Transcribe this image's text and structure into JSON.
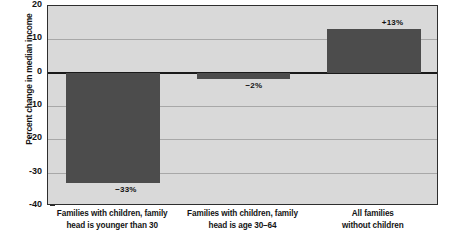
{
  "chart_data": {
    "type": "bar",
    "title": "",
    "subtitle": "",
    "xlabel": "",
    "ylabel": "Percent change in median income",
    "ylim": [
      -40,
      20
    ],
    "ytick_values": [
      20,
      10,
      0,
      -10,
      -20,
      -30,
      -40
    ],
    "ytick_labels": [
      "20",
      "10",
      "0",
      "-10",
      "-20",
      "-30",
      "-40"
    ],
    "grid": true,
    "legend": "none",
    "categories": [
      "Families with children, family head is younger than 30",
      "Families with children, family head is age 30–64",
      "All families without children"
    ],
    "category_lines": [
      [
        "Families with children, family",
        "head is younger than 30"
      ],
      [
        "Families with children, family",
        "head is age 30–64"
      ],
      [
        "All families",
        "without children"
      ]
    ],
    "values": [
      -33,
      -2,
      13
    ],
    "value_labels": [
      "−33%",
      "−2%",
      "+13%"
    ],
    "bar_color": "#4c4c4c",
    "plot_background": "#d9d9d9",
    "axis_color": "#2e2e2e",
    "gridline_color": "#a8a8a8",
    "zero_line_color": "#1a1a1a"
  }
}
